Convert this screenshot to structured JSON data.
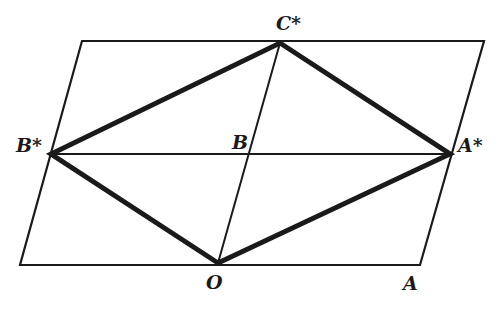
{
  "diagram": {
    "type": "geometry-lattice",
    "colors": {
      "stroke": "#1a1a1a",
      "background": "#ffffff"
    },
    "points": {
      "O": {
        "label": "O",
        "x": 218,
        "y": 263
      },
      "A": {
        "label": "A",
        "x": 420,
        "y": 265
      },
      "B": {
        "label": "B",
        "x": 250,
        "y": 154
      },
      "A_star": {
        "label": "A*",
        "x": 450,
        "y": 154
      },
      "B_star": {
        "label": "B*",
        "x": 51,
        "y": 154
      },
      "C_star": {
        "label": "C*",
        "x": 280,
        "y": 43
      }
    },
    "outer_parallelogram": [
      [
        82,
        41
      ],
      [
        484,
        41
      ],
      [
        420,
        265
      ],
      [
        20,
        265
      ]
    ],
    "thin_lines": [
      {
        "from": "B_star",
        "to": "A_star"
      },
      {
        "from": "O",
        "to": "C_star"
      }
    ],
    "thick_rhombus": [
      "O",
      "A_star",
      "C_star",
      "B_star"
    ],
    "labels": {
      "O": "O",
      "A": "A",
      "B": "B",
      "A_star": "A*",
      "B_star": "B*",
      "C_star": "C*"
    }
  }
}
